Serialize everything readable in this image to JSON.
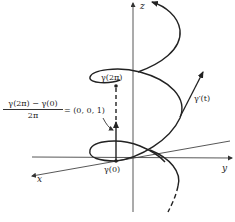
{
  "diagram": {
    "type": "helix-3d",
    "axes": {
      "x_label": "x",
      "y_label": "y",
      "z_label": "z"
    },
    "labels": {
      "gamma_2pi": "γ(2π)",
      "gamma_0": "γ(0)",
      "gamma_prime": "γ′(t)",
      "fraction_numerator": "γ(2π) − γ(0)",
      "fraction_denominator": "2π",
      "equals_value": "= (0, 0, 1)"
    },
    "colors": {
      "stroke": "#222222",
      "axis": "#444444"
    }
  }
}
